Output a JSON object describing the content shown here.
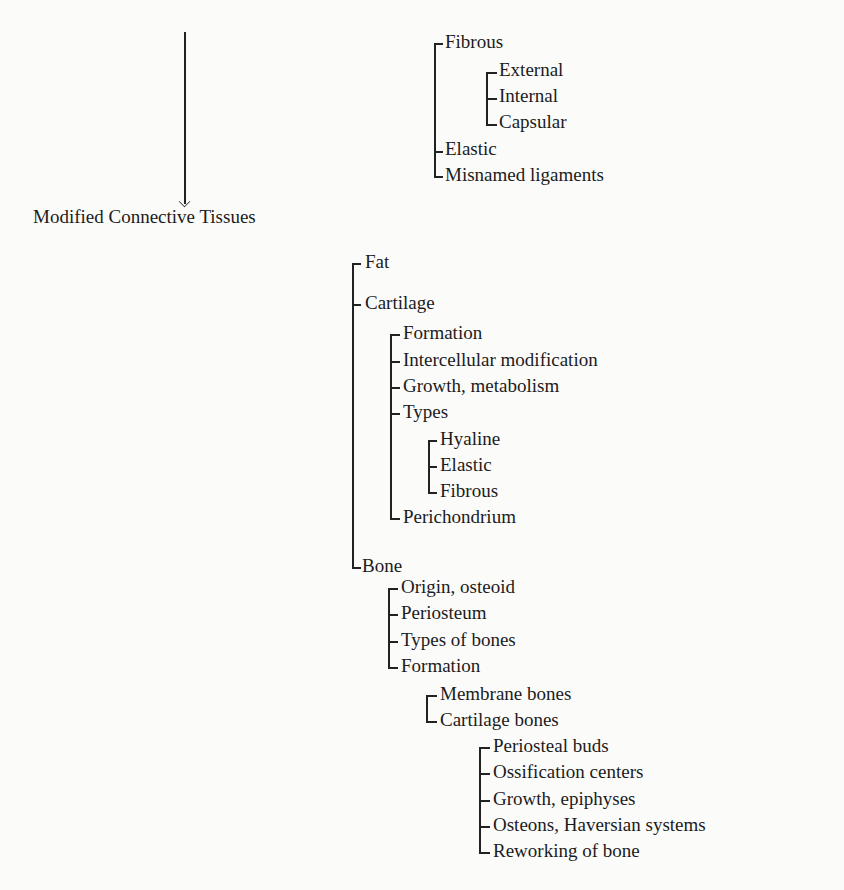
{
  "root": {
    "label": "Modified Connective Tissues",
    "arrow": "down-arrow"
  },
  "ligaments": {
    "items": [
      {
        "label": "Fibrous",
        "children": [
          {
            "label": "External"
          },
          {
            "label": "Internal"
          },
          {
            "label": "Capsular"
          }
        ]
      },
      {
        "label": "Elastic"
      },
      {
        "label": "Misnamed ligaments"
      }
    ]
  },
  "tissues": {
    "fat": "Fat",
    "cartilage": {
      "label": "Cartilage",
      "children": [
        "Formation",
        "Intercellular modification",
        "Growth, metabolism",
        "Types",
        "Perichondrium"
      ],
      "types": [
        "Hyaline",
        "Elastic",
        "Fibrous"
      ]
    },
    "bone": {
      "label": "Bone",
      "children": [
        "Origin, osteoid",
        "Periosteum",
        "Types of bones",
        "Formation"
      ],
      "formation": [
        "Membrane bones",
        "Cartilage bones"
      ],
      "cartilage_bones": [
        "Periosteal buds",
        "Ossification centers",
        "Growth, epiphyses",
        "Osteons, Haversian systems",
        "Reworking of bone"
      ]
    }
  }
}
